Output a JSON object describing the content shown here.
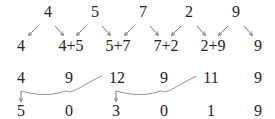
{
  "diagram": {
    "row1_digits": [
      "4",
      "5",
      "7",
      "2",
      "9"
    ],
    "row2_terms": [
      "4",
      "4+5",
      "5+7",
      "7+2",
      "2+9",
      "9"
    ],
    "row3_sums": [
      "4",
      "9",
      "12",
      "9",
      "11",
      "9"
    ],
    "row4_result": [
      "5",
      "0",
      "3",
      "0",
      "1",
      "9"
    ],
    "colors": {
      "text": "#222222",
      "arrow": "#555555",
      "carry_line": "#777777"
    }
  }
}
